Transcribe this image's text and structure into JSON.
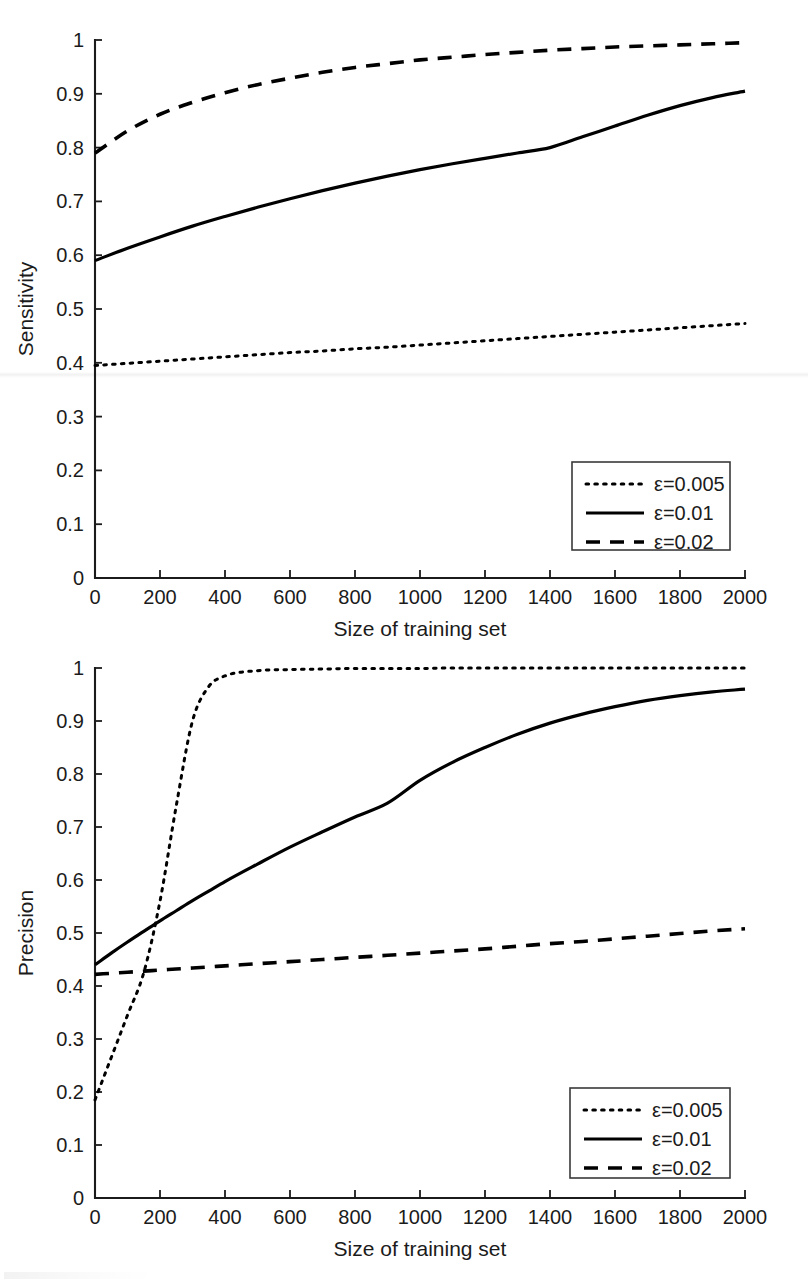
{
  "figure": {
    "kind": "two-panel-line-chart",
    "panels": [
      "sensitivity",
      "precision"
    ]
  },
  "chart_data": [
    {
      "type": "line",
      "id": "sensitivity",
      "title": "",
      "xlabel": "Size of training set",
      "ylabel": "Sensitivity",
      "xlim": [
        0,
        2000
      ],
      "ylim": [
        0,
        1
      ],
      "xticks": [
        0,
        200,
        400,
        600,
        800,
        1000,
        1200,
        1400,
        1600,
        1800,
        2000
      ],
      "xticklabels": [
        "0",
        "200",
        "400",
        "600",
        "800",
        "1000",
        "1200",
        "1400",
        "1600",
        "1800",
        "2000"
      ],
      "yticks": [
        0,
        0.1,
        0.2,
        0.3,
        0.4,
        0.5,
        0.6,
        0.7,
        0.8,
        0.9,
        1
      ],
      "yticklabels": [
        "0",
        "0.1",
        "0.2",
        "0.3",
        "0.4",
        "0.5",
        "0.6",
        "0.7",
        "0.8",
        "0.9",
        "1"
      ],
      "grid": false,
      "legend_position": "lower-right",
      "x": [
        0,
        100,
        200,
        300,
        400,
        500,
        600,
        700,
        800,
        900,
        1000,
        1100,
        1200,
        1300,
        1400,
        1500,
        1600,
        1700,
        1800,
        1900,
        2000
      ],
      "series": [
        {
          "name": "ε=0.005",
          "style": "dotted",
          "color": "#000000",
          "values": [
            0.395,
            0.399,
            0.403,
            0.407,
            0.411,
            0.415,
            0.419,
            0.422,
            0.426,
            0.429,
            0.433,
            0.437,
            0.441,
            0.445,
            0.449,
            0.453,
            0.457,
            0.461,
            0.465,
            0.469,
            0.473
          ]
        },
        {
          "name": "ε=0.01",
          "style": "solid",
          "color": "#000000",
          "values": [
            0.59,
            0.613,
            0.634,
            0.654,
            0.672,
            0.689,
            0.705,
            0.72,
            0.734,
            0.747,
            0.759,
            0.77,
            0.78,
            0.79,
            0.8,
            0.82,
            0.84,
            0.86,
            0.878,
            0.893,
            0.905
          ]
        },
        {
          "name": "ε=0.02",
          "style": "dashed",
          "color": "#000000",
          "values": [
            0.79,
            0.831,
            0.862,
            0.884,
            0.902,
            0.917,
            0.929,
            0.94,
            0.949,
            0.956,
            0.963,
            0.968,
            0.973,
            0.977,
            0.981,
            0.984,
            0.987,
            0.989,
            0.991,
            0.993,
            0.995
          ]
        }
      ]
    },
    {
      "type": "line",
      "id": "precision",
      "title": "",
      "xlabel": "Size of training set",
      "ylabel": "Precision",
      "xlim": [
        0,
        2000
      ],
      "ylim": [
        0,
        1
      ],
      "xticks": [
        0,
        200,
        400,
        600,
        800,
        1000,
        1200,
        1400,
        1600,
        1800,
        2000
      ],
      "xticklabels": [
        "0",
        "200",
        "400",
        "600",
        "800",
        "1000",
        "1200",
        "1400",
        "1600",
        "1800",
        "2000"
      ],
      "yticks": [
        0,
        0.1,
        0.2,
        0.3,
        0.4,
        0.5,
        0.6,
        0.7,
        0.8,
        0.9,
        1
      ],
      "yticklabels": [
        "0",
        "0.1",
        "0.2",
        "0.3",
        "0.4",
        "0.5",
        "0.6",
        "0.7",
        "0.8",
        "0.9",
        "1"
      ],
      "grid": false,
      "legend_position": "lower-right",
      "x": [
        0,
        50,
        100,
        150,
        200,
        250,
        300,
        350,
        400,
        500,
        600,
        700,
        800,
        900,
        1000,
        1100,
        1200,
        1300,
        1400,
        1500,
        1600,
        1700,
        1800,
        1900,
        2000
      ],
      "series": [
        {
          "name": "ε=0.005",
          "style": "dotted",
          "color": "#000000",
          "values": [
            0.185,
            0.265,
            0.345,
            0.425,
            0.56,
            0.74,
            0.9,
            0.965,
            0.985,
            0.995,
            0.997,
            0.998,
            0.999,
            0.999,
            0.999,
            1.0,
            1.0,
            1.0,
            1.0,
            1.0,
            1.0,
            1.0,
            1.0,
            1.0,
            1.0
          ]
        },
        {
          "name": "ε=0.01",
          "style": "solid",
          "color": "#000000",
          "values": [
            0.44,
            0.462,
            0.483,
            0.503,
            0.523,
            0.542,
            0.561,
            0.579,
            0.597,
            0.63,
            0.662,
            0.691,
            0.719,
            0.745,
            0.788,
            0.822,
            0.85,
            0.875,
            0.896,
            0.913,
            0.927,
            0.939,
            0.948,
            0.955,
            0.96
          ]
        },
        {
          "name": "ε=0.02",
          "style": "dashed",
          "color": "#000000",
          "values": [
            0.422,
            0.424,
            0.426,
            0.428,
            0.43,
            0.432,
            0.434,
            0.436,
            0.438,
            0.442,
            0.446,
            0.45,
            0.454,
            0.458,
            0.462,
            0.466,
            0.47,
            0.475,
            0.48,
            0.484,
            0.489,
            0.494,
            0.499,
            0.504,
            0.508
          ]
        }
      ]
    }
  ],
  "legend": {
    "entries": [
      {
        "label": "ε=0.005",
        "style": "dotted"
      },
      {
        "label": "ε=0.01",
        "style": "solid"
      },
      {
        "label": "ε=0.02",
        "style": "dashed"
      }
    ]
  },
  "colors": {
    "line": "#000000",
    "axis": "#1b1b1b",
    "background": "#ffffff",
    "legend_border": "#3a3a3a"
  }
}
